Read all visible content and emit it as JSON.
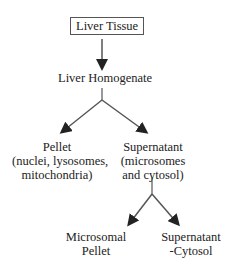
{
  "nodes": {
    "root": {
      "label": "Liver Tissue"
    },
    "homogenate": {
      "label": "Liver Homogenate"
    },
    "pellet": {
      "label": "Pellet",
      "sub1": "(nuclei, lysosomes,",
      "sub2": "mitochondria)"
    },
    "supernatant": {
      "label": "Supernatant",
      "sub1": "(microsomes",
      "sub2": "and cytosol)"
    },
    "microsomal": {
      "line1": "Microsomal",
      "line2": "Pellet"
    },
    "cytosol": {
      "line1": "Supernatant",
      "line2": "-Cytosol"
    }
  }
}
